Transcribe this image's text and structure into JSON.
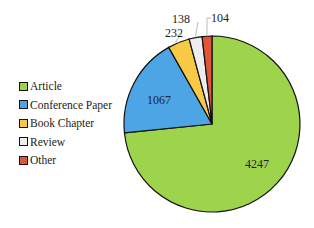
{
  "chart_data": {
    "type": "pie",
    "title": "",
    "categories": [
      "Article",
      "Conference Paper",
      "Book Chapter",
      "Review",
      "Other"
    ],
    "values": [
      4247,
      1067,
      232,
      138,
      104
    ],
    "colors": [
      "#9ed44b",
      "#4ea5e6",
      "#f7c944",
      "#ededed",
      "#e2543a"
    ],
    "data_labels": [
      "4247",
      "1067",
      "232",
      "138",
      "104"
    ],
    "legend_position": "left",
    "start_angle_deg": 0,
    "direction": "clockwise"
  },
  "legend": {
    "items": [
      {
        "label": "Article",
        "color": "#9ed44b"
      },
      {
        "label": "Conference Paper",
        "color": "#4ea5e6"
      },
      {
        "label": "Book Chapter",
        "color": "#f7c944"
      },
      {
        "label": "Review",
        "color": "#ededed"
      },
      {
        "label": "Other",
        "color": "#e2543a"
      }
    ]
  }
}
